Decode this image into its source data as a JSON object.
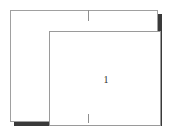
{
  "diagram": {
    "background_color": "#ffffff",
    "outer_frame": {
      "name": "outer rectangle",
      "stroke_color": "#a0a0a0",
      "fill_color": "#ffffff",
      "shadow_color": "#3a3a3a"
    },
    "inner_frame": {
      "name": "inner rectangle",
      "stroke_color": "#9a9a9a",
      "fill_color": "#ffffff"
    },
    "ticks": [
      {
        "id": "top-center-tick",
        "position": "top",
        "stroke_color": "#8f8f8f"
      },
      {
        "id": "bottom-center-tick",
        "position": "bottom",
        "stroke_color": "#8f8f8f"
      }
    ],
    "labels": [
      {
        "id": "region-label-1",
        "text": "1",
        "color": "#2b2b2b"
      }
    ]
  }
}
